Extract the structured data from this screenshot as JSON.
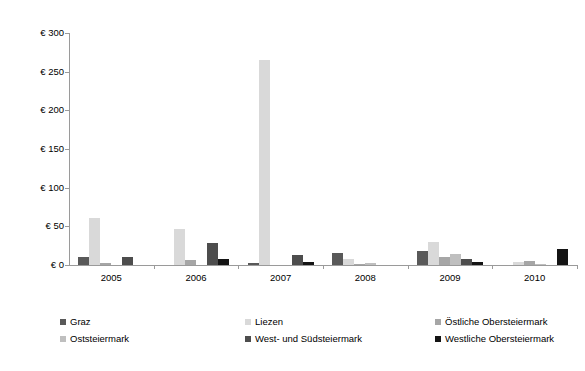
{
  "chart_data": {
    "type": "bar",
    "title": "",
    "subtitle": "",
    "xlabel": "",
    "ylabel": "",
    "categories": [
      "2005",
      "2006",
      "2007",
      "2008",
      "2009",
      "2010"
    ],
    "ylim": [
      0,
      300
    ],
    "y_ticks": [
      0,
      50,
      100,
      150,
      200,
      250,
      300
    ],
    "y_tick_labels": [
      "€ 0",
      "€ 50",
      "€ 100",
      "€ 150",
      "€ 200",
      "€ 250",
      "€ 300"
    ],
    "currency_symbol": "€",
    "grid": false,
    "legend_position": "bottom",
    "series": [
      {
        "name": "Graz",
        "color": "#595959",
        "values": [
          11,
          0,
          2,
          15,
          18,
          0
        ]
      },
      {
        "name": "Liezen",
        "color": "#d9d9d9",
        "values": [
          61,
          47,
          265,
          8,
          30,
          4
        ]
      },
      {
        "name": "Östliche Obersteiermark",
        "color": "#a6a6a6",
        "values": [
          2,
          7,
          0,
          1,
          10,
          5
        ]
      },
      {
        "name": "Oststeiermark",
        "color": "#bfbfbf",
        "values": [
          0,
          0,
          0,
          2,
          14,
          1
        ]
      },
      {
        "name": "West- und Südsteiermark",
        "color": "#4d4d4d",
        "values": [
          11,
          28,
          13,
          0,
          8,
          0
        ]
      },
      {
        "name": "Westliche Obersteiermark",
        "color": "#141414",
        "values": [
          0,
          8,
          4,
          0,
          4,
          21
        ]
      }
    ]
  },
  "legend": {
    "items": [
      {
        "label": "Graz",
        "color": "#595959"
      },
      {
        "label": "Liezen",
        "color": "#d9d9d9"
      },
      {
        "label": "Östliche Obersteiermark",
        "color": "#a6a6a6"
      },
      {
        "label": "Oststeiermark",
        "color": "#bfbfbf"
      },
      {
        "label": "West- und Südsteiermark",
        "color": "#4d4d4d"
      },
      {
        "label": "Westliche Obersteiermark",
        "color": "#141414"
      }
    ]
  }
}
